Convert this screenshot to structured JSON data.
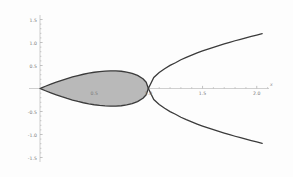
{
  "chart_data": {
    "type": "line",
    "title": "",
    "subtitle": "",
    "xlabel": "x",
    "ylabel": "",
    "xlim": [
      -0.12,
      2.15
    ],
    "ylim": [
      -1.62,
      1.62
    ],
    "grid": false,
    "legend": null,
    "annotations": [],
    "background_color": "#fdfdfd",
    "curve_color": "#3b3b3b",
    "fill_color": "#b9b9b9",
    "axis_color": "#b0b0b0",
    "tick_color": "#9a9a9a",
    "label_color": "#7a7a7a",
    "equation": "y^2 = x^2 (1 - x)",
    "node_point": [
      1.0,
      0.0
    ],
    "xticks": [
      0.5,
      1.0,
      1.5,
      2.0
    ],
    "xtick_labels": [
      "0.5",
      "1.0",
      "1.5",
      "2.0"
    ],
    "yticks": [
      -1.5,
      -1.0,
      -0.5,
      0.5,
      1.0,
      1.5
    ],
    "ytick_labels": [
      "-1.5",
      "-1.0",
      "-0.5",
      "0.5",
      "1.0",
      "1.5"
    ],
    "x_minor_ticks": [
      0.1,
      0.2,
      0.3,
      0.4,
      0.6,
      0.7,
      0.8,
      0.9,
      1.1,
      1.2,
      1.3,
      1.4,
      1.6,
      1.7,
      1.8,
      1.9,
      2.1
    ],
    "y_minor_ticks": [
      -1.4,
      -1.3,
      -1.2,
      -1.1,
      -0.9,
      -0.8,
      -0.7,
      -0.6,
      -0.4,
      -0.3,
      -0.2,
      -0.1,
      0.1,
      0.2,
      0.3,
      0.4,
      0.6,
      0.7,
      0.8,
      0.9,
      1.1,
      1.2,
      1.3,
      1.4
    ],
    "series": [
      {
        "name": "loop-upper",
        "shaded": true,
        "x": [
          0.0,
          0.02,
          0.05,
          0.1,
          0.15,
          0.2,
          0.25,
          0.3,
          0.35,
          0.4,
          0.45,
          0.5,
          0.55,
          0.6,
          0.65,
          0.667,
          0.7,
          0.75,
          0.8,
          0.85,
          0.9,
          0.95,
          0.98,
          1.0
        ],
        "y": [
          0.0,
          0.0198,
          0.0487,
          0.0949,
          0.1384,
          0.1789,
          0.2165,
          0.251,
          0.2823,
          0.3098,
          0.3338,
          0.3536,
          0.3691,
          0.3795,
          0.3842,
          0.3849,
          0.3834,
          0.375,
          0.3578,
          0.3292,
          0.2846,
          0.2125,
          0.1372,
          0.0
        ]
      },
      {
        "name": "loop-lower",
        "shaded": true,
        "x": [
          0.0,
          0.02,
          0.05,
          0.1,
          0.15,
          0.2,
          0.25,
          0.3,
          0.35,
          0.4,
          0.45,
          0.5,
          0.55,
          0.6,
          0.65,
          0.667,
          0.7,
          0.75,
          0.8,
          0.85,
          0.9,
          0.95,
          0.98,
          1.0
        ],
        "y": [
          0.0,
          -0.0198,
          -0.0487,
          -0.0949,
          -0.1384,
          -0.1789,
          -0.2165,
          -0.251,
          -0.2823,
          -0.3098,
          -0.3338,
          -0.3536,
          -0.3691,
          -0.3795,
          -0.3842,
          -0.3849,
          -0.3834,
          -0.375,
          -0.3578,
          -0.3292,
          -0.2846,
          -0.2125,
          -0.1372,
          0.0
        ]
      },
      {
        "name": "branch-upper",
        "shaded": false,
        "x": [
          1.0,
          1.05,
          1.1,
          1.15,
          1.2,
          1.25,
          1.3,
          1.35,
          1.4,
          1.45,
          1.5,
          1.55,
          1.6,
          1.65,
          1.7,
          1.75,
          1.8,
          1.85,
          1.9,
          1.95,
          2.0,
          2.05
        ],
        "y": [
          0.0,
          0.2408,
          0.3464,
          0.4301,
          0.502,
          0.559,
          0.6245,
          0.6775,
          0.7266,
          0.7726,
          0.8159,
          0.8571,
          0.8963,
          0.9339,
          0.97,
          1.0047,
          1.0383,
          1.0708,
          1.1023,
          1.1328,
          1.1626,
          1.1916
        ]
      },
      {
        "name": "branch-lower",
        "shaded": false,
        "x": [
          1.0,
          1.05,
          1.1,
          1.15,
          1.2,
          1.25,
          1.3,
          1.35,
          1.4,
          1.45,
          1.5,
          1.55,
          1.6,
          1.65,
          1.7,
          1.75,
          1.8,
          1.85,
          1.9,
          1.95,
          2.0,
          2.05
        ],
        "y": [
          0.0,
          -0.2408,
          -0.3464,
          -0.4301,
          -0.502,
          -0.559,
          -0.6245,
          -0.6775,
          -0.7266,
          -0.7726,
          -0.8159,
          -0.8571,
          -0.8963,
          -0.9339,
          -0.97,
          -1.0047,
          -1.0383,
          -1.0708,
          -1.1023,
          -1.1328,
          -1.1626,
          -1.1916
        ]
      }
    ]
  }
}
